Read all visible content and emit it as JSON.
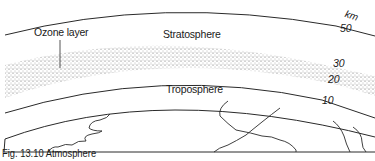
{
  "diagram": {
    "type": "atmosphere-cross-section",
    "labels": {
      "ozone_layer": "Ozone layer",
      "stratosphere": "Stratosphere",
      "troposphere": "Troposphere"
    },
    "altitude_scale": {
      "unit": "km",
      "ticks": [
        "50",
        "30",
        "20",
        "10"
      ]
    },
    "caption": "Fig. 13.10 Atmosphere",
    "colors": {
      "line": "#2a2a2a",
      "stipple": "#555555",
      "background": "#ffffff"
    }
  }
}
